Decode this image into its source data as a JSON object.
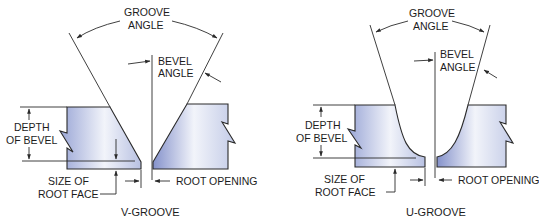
{
  "figures": [
    {
      "id": "v-groove",
      "caption": "V-GROOVE",
      "labels": {
        "groove_angle_1": "GROOVE",
        "groove_angle_2": "ANGLE",
        "bevel_angle_1": "BEVEL",
        "bevel_angle_2": "ANGLE",
        "depth_of_bevel_1": "DEPTH",
        "depth_of_bevel_2": "OF BEVEL",
        "size_of_root_face_1": "SIZE OF",
        "size_of_root_face_2": "ROOT FACE",
        "root_opening": "ROOT OPENING"
      }
    },
    {
      "id": "u-groove",
      "caption": "U-GROOVE",
      "labels": {
        "groove_angle_1": "GROOVE",
        "groove_angle_2": "ANGLE",
        "bevel_angle_1": "BEVEL",
        "bevel_angle_2": "ANGLE",
        "depth_of_bevel_1": "DEPTH",
        "depth_of_bevel_2": "OF BEVEL",
        "size_of_root_face_1": "SIZE OF",
        "size_of_root_face_2": "ROOT FACE",
        "root_opening": "ROOT OPENING"
      }
    }
  ],
  "colors": {
    "line": "#2a2a2a",
    "plate_light": "#f4f6fb",
    "plate_dark": "#8e9bcf"
  }
}
